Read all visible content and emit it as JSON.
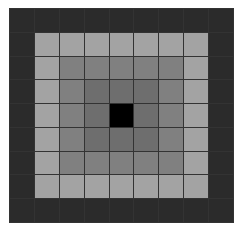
{
  "figure": {
    "name": "concentric-grayscale-grid",
    "background_color": "#ffffff",
    "grid_line_color": "#333333",
    "grid_line_width_px": 1
  },
  "chart_data": {
    "type": "heatmap",
    "title": "",
    "subtitle": "",
    "xlabel": "",
    "ylabel": "",
    "rows": 9,
    "cols": 9,
    "grid": true,
    "legend": "none",
    "x": [
      0,
      1,
      2,
      3,
      4,
      5,
      6,
      7,
      8
    ],
    "y": [
      0,
      1,
      2,
      3,
      4,
      5,
      6,
      7,
      8
    ],
    "xticklabels": [],
    "yticklabels": [],
    "colorscale": "grayscale",
    "zlim": [
      0,
      4
    ],
    "ring_levels": [
      {
        "ring": 0,
        "label": "outer",
        "value": 4,
        "color": "#2b2b2b"
      },
      {
        "ring": 1,
        "label": "light",
        "value": 1,
        "color": "#a3a3a3"
      },
      {
        "ring": 2,
        "label": "medium",
        "value": 2,
        "color": "#808080"
      },
      {
        "ring": 3,
        "label": "dark-medium",
        "value": 3,
        "color": "#6e6e6e"
      },
      {
        "ring": 4,
        "label": "center",
        "value": 0,
        "color": "#000000"
      }
    ],
    "values": [
      [
        4,
        4,
        4,
        4,
        4,
        4,
        4,
        4,
        4
      ],
      [
        4,
        1,
        1,
        1,
        1,
        1,
        1,
        1,
        4
      ],
      [
        4,
        1,
        2,
        2,
        2,
        2,
        2,
        1,
        4
      ],
      [
        4,
        1,
        2,
        3,
        3,
        3,
        2,
        1,
        4
      ],
      [
        4,
        1,
        2,
        3,
        0,
        3,
        2,
        1,
        4
      ],
      [
        4,
        1,
        2,
        3,
        3,
        3,
        2,
        1,
        4
      ],
      [
        4,
        1,
        2,
        2,
        2,
        2,
        2,
        1,
        4
      ],
      [
        4,
        1,
        1,
        1,
        1,
        1,
        1,
        1,
        4
      ],
      [
        4,
        4,
        4,
        4,
        4,
        4,
        4,
        4,
        4
      ]
    ],
    "colors": [
      [
        "#2b2b2b",
        "#2b2b2b",
        "#2b2b2b",
        "#2b2b2b",
        "#2b2b2b",
        "#2b2b2b",
        "#2b2b2b",
        "#2b2b2b",
        "#2b2b2b"
      ],
      [
        "#2b2b2b",
        "#a3a3a3",
        "#a3a3a3",
        "#a3a3a3",
        "#a3a3a3",
        "#a3a3a3",
        "#a3a3a3",
        "#a3a3a3",
        "#2b2b2b"
      ],
      [
        "#2b2b2b",
        "#a3a3a3",
        "#808080",
        "#808080",
        "#808080",
        "#808080",
        "#808080",
        "#a3a3a3",
        "#2b2b2b"
      ],
      [
        "#2b2b2b",
        "#a3a3a3",
        "#808080",
        "#6e6e6e",
        "#6e6e6e",
        "#6e6e6e",
        "#808080",
        "#a3a3a3",
        "#2b2b2b"
      ],
      [
        "#2b2b2b",
        "#a3a3a3",
        "#808080",
        "#6e6e6e",
        "#000000",
        "#6e6e6e",
        "#808080",
        "#a3a3a3",
        "#2b2b2b"
      ],
      [
        "#2b2b2b",
        "#a3a3a3",
        "#808080",
        "#6e6e6e",
        "#6e6e6e",
        "#6e6e6e",
        "#808080",
        "#a3a3a3",
        "#2b2b2b"
      ],
      [
        "#2b2b2b",
        "#a3a3a3",
        "#808080",
        "#808080",
        "#808080",
        "#808080",
        "#808080",
        "#a3a3a3",
        "#2b2b2b"
      ],
      [
        "#2b2b2b",
        "#a3a3a3",
        "#a3a3a3",
        "#a3a3a3",
        "#a3a3a3",
        "#a3a3a3",
        "#a3a3a3",
        "#a3a3a3",
        "#2b2b2b"
      ],
      [
        "#2b2b2b",
        "#2b2b2b",
        "#2b2b2b",
        "#2b2b2b",
        "#2b2b2b",
        "#2b2b2b",
        "#2b2b2b",
        "#2b2b2b",
        "#2b2b2b"
      ]
    ]
  }
}
